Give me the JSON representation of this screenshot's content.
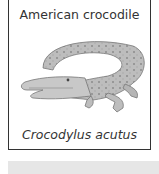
{
  "card": {
    "common_name": "American crocodile",
    "scientific_name": "Crocodylus acutus",
    "image": {
      "icon": "crocodile-illustration",
      "alt": "American crocodile"
    }
  },
  "colors": {
    "border": "#333333",
    "bar": "#e6e6e6",
    "text": "#333333"
  }
}
